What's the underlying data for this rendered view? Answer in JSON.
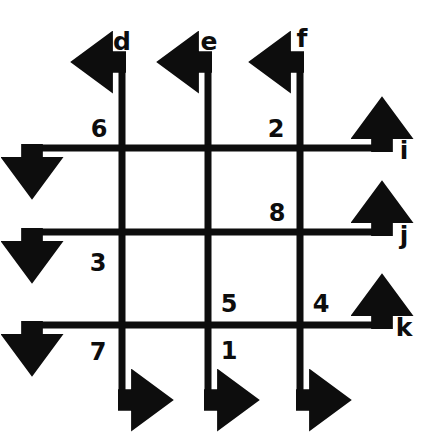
{
  "figure": {
    "background_color": "#ffffff",
    "stroke_color": "#0d0d0d",
    "stroke_width": 7,
    "width": 432,
    "height": 433
  },
  "lines": {
    "vertical": [
      {
        "name": "d",
        "label": "d",
        "x": 122,
        "y_top": 62,
        "y_bottom": 400,
        "label_x": 122,
        "label_y": 41
      },
      {
        "name": "e",
        "label": "e",
        "x": 208,
        "y_top": 62,
        "y_bottom": 400,
        "label_x": 209,
        "label_y": 41
      },
      {
        "name": "f",
        "label": "f",
        "x": 300,
        "y_top": 62,
        "y_bottom": 400,
        "label_x": 302,
        "label_y": 38
      }
    ],
    "horizontal": [
      {
        "name": "i",
        "label": "i",
        "y": 148,
        "x_left": 32,
        "x_right": 382,
        "label_x": 404,
        "label_y": 150
      },
      {
        "name": "j",
        "label": "j",
        "y": 232,
        "x_left": 32,
        "x_right": 382,
        "label_x": 404,
        "label_y": 235
      },
      {
        "name": "k",
        "label": "k",
        "y": 325,
        "x_left": 32,
        "x_right": 382,
        "label_x": 404,
        "label_y": 327
      }
    ]
  },
  "angles": [
    {
      "id": "6",
      "label": "6",
      "x": 99,
      "y": 129,
      "at_intersection": "d-i",
      "quadrant": "upper-left"
    },
    {
      "id": "2",
      "label": "2",
      "x": 276,
      "y": 129,
      "at_intersection": "f-i",
      "quadrant": "upper-left"
    },
    {
      "id": "8",
      "label": "8",
      "x": 277,
      "y": 213,
      "at_intersection": "f-j",
      "quadrant": "upper-left"
    },
    {
      "id": "3",
      "label": "3",
      "x": 98,
      "y": 263,
      "at_intersection": "d-j",
      "quadrant": "lower-left"
    },
    {
      "id": "5",
      "label": "5",
      "x": 229,
      "y": 304,
      "at_intersection": "e-k",
      "quadrant": "upper-right"
    },
    {
      "id": "4",
      "label": "4",
      "x": 321,
      "y": 304,
      "at_intersection": "f-k",
      "quadrant": "upper-right"
    },
    {
      "id": "1",
      "label": "1",
      "x": 229,
      "y": 351,
      "at_intersection": "e-k",
      "quadrant": "lower-right"
    },
    {
      "id": "7",
      "label": "7",
      "x": 98,
      "y": 352,
      "at_intersection": "d-k",
      "quadrant": "lower-left"
    }
  ],
  "arrowheads": {
    "style": "solid-filled-triangle",
    "count": 12,
    "directions": [
      "up",
      "up",
      "up",
      "down",
      "down",
      "down",
      "left",
      "left",
      "left",
      "right",
      "right",
      "right"
    ]
  }
}
